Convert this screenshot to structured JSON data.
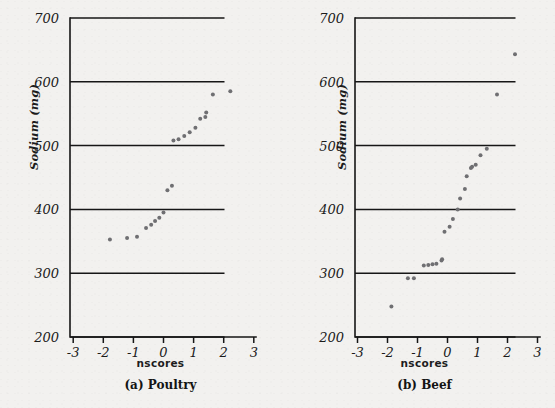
{
  "figure": {
    "background_color": "#f2f1ef",
    "dot_color": "#6f6f72",
    "axis_color": "#161616"
  },
  "chart_data": [
    {
      "type": "scatter",
      "title": "(a) Poultry",
      "xlabel": "nscores",
      "ylabel": "Sodium (mg)",
      "xlim": [
        -3,
        3
      ],
      "ylim": [
        200,
        700
      ],
      "xticks": [
        -3,
        -2,
        -1,
        0,
        1,
        2,
        3
      ],
      "xticklabels": [
        "-3",
        "-2",
        "-1",
        "0",
        "1",
        "2",
        "3"
      ],
      "yticks": [
        200,
        300,
        400,
        500,
        600,
        700
      ],
      "yticklabels": [
        "200",
        "300",
        "400",
        "500",
        "600",
        "700"
      ],
      "grid": false,
      "legend": null,
      "x": [
        -1.78,
        -1.21,
        -0.88,
        -0.58,
        -0.41,
        -0.28,
        -0.14,
        0.0,
        0.13,
        0.28,
        0.33,
        0.5,
        0.69,
        0.87,
        1.06,
        1.22,
        1.39,
        1.42,
        1.64,
        2.22
      ],
      "y": [
        353,
        355,
        357,
        371,
        376,
        382,
        387,
        395,
        430,
        437,
        508,
        510,
        515,
        521,
        528,
        542,
        545,
        552,
        580,
        585
      ]
    },
    {
      "type": "scatter",
      "title": "(b) Beef",
      "xlabel": "nscores",
      "ylabel": "Sodium (mg)",
      "xlim": [
        -3,
        3
      ],
      "ylim": [
        200,
        700
      ],
      "xticks": [
        -3,
        -2,
        -1,
        0,
        1,
        2,
        3
      ],
      "xticklabels": [
        "-3",
        "-2",
        "-1",
        "0",
        "1",
        "2",
        "3"
      ],
      "yticks": [
        200,
        300,
        400,
        500,
        600,
        700
      ],
      "yticklabels": [
        "200",
        "300",
        "400",
        "500",
        "600",
        "700"
      ],
      "grid": false,
      "legend": null,
      "x": [
        -1.87,
        -1.32,
        -1.12,
        -0.79,
        -0.64,
        -0.5,
        -0.37,
        -0.2,
        -0.18,
        -0.1,
        0.07,
        0.18,
        0.34,
        0.42,
        0.58,
        0.64,
        0.78,
        0.82,
        0.94,
        1.1,
        1.31,
        1.65,
        2.25
      ],
      "y": [
        248,
        292,
        292,
        312,
        313,
        314,
        315,
        320,
        322,
        365,
        373,
        385,
        400,
        417,
        432,
        452,
        465,
        467,
        470,
        485,
        495,
        580,
        643
      ]
    }
  ],
  "panels": [
    {
      "id": "poultry",
      "caption": "(a) Poultry",
      "xlabel": "nscores",
      "ylabel": "Sodium (mg)"
    },
    {
      "id": "beef",
      "caption": "(b) Beef",
      "xlabel": "nscores",
      "ylabel": "Sodium (mg)"
    }
  ]
}
